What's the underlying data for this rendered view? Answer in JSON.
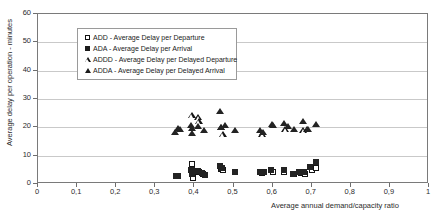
{
  "chart_data": {
    "type": "scatter",
    "title": "",
    "xlabel": "Average annual demand/capacity ratio",
    "ylabel": "Average delay per operation - minutes",
    "xlim": [
      0,
      1
    ],
    "ylim": [
      0,
      60
    ],
    "grid": "horizontal",
    "legend_position": "top-left-inside",
    "xticks": [
      "0",
      "0,1",
      "0,2",
      "0,3",
      "0,4",
      "0,5",
      "0,6",
      "0,7",
      "0,8",
      "0,9",
      "1"
    ],
    "xtick_values": [
      0,
      0.1,
      0.2,
      0.3,
      0.4,
      0.5,
      0.6,
      0.7,
      0.8,
      0.9,
      1
    ],
    "yticks": [
      "0",
      "10",
      "20",
      "30",
      "40",
      "50",
      "60"
    ],
    "ytick_values": [
      0,
      10,
      20,
      30,
      40,
      50,
      60
    ],
    "series": [
      {
        "name": "ADD - Average Delay per Departure",
        "key": "ADD",
        "marker": "square-open",
        "color": "#141414",
        "points": [
          [
            0.395,
            7.0
          ],
          [
            0.396,
            4.4
          ],
          [
            0.397,
            2.2
          ],
          [
            0.405,
            4.6
          ],
          [
            0.412,
            4.2
          ],
          [
            0.423,
            3.4
          ],
          [
            0.468,
            5.2
          ],
          [
            0.474,
            4.9
          ],
          [
            0.573,
            4.0
          ],
          [
            0.6,
            4.3
          ],
          [
            0.63,
            4.4
          ],
          [
            0.655,
            3.5
          ],
          [
            0.672,
            3.9
          ],
          [
            0.684,
            3.6
          ],
          [
            0.7,
            4.9
          ],
          [
            0.712,
            5.8
          ]
        ]
      },
      {
        "name": "ADA - Average Delay per Arrival",
        "key": "ADA",
        "marker": "square-filled",
        "color": "#232323",
        "points": [
          [
            0.352,
            3.0
          ],
          [
            0.357,
            2.9
          ],
          [
            0.392,
            5.1
          ],
          [
            0.393,
            3.7
          ],
          [
            0.394,
            4.9
          ],
          [
            0.408,
            4.6
          ],
          [
            0.42,
            4.0
          ],
          [
            0.427,
            3.1
          ],
          [
            0.466,
            6.3
          ],
          [
            0.47,
            5.6
          ],
          [
            0.504,
            4.2
          ],
          [
            0.568,
            4.3
          ],
          [
            0.578,
            4.1
          ],
          [
            0.597,
            5.0
          ],
          [
            0.628,
            5.0
          ],
          [
            0.652,
            3.6
          ],
          [
            0.668,
            4.1
          ],
          [
            0.68,
            4.3
          ],
          [
            0.695,
            6.0
          ],
          [
            0.71,
            7.7
          ]
        ]
      },
      {
        "name": "ADDD - Average Delay per Delayed Departure",
        "key": "ADDD",
        "marker": "triangle-open",
        "color": "#141414",
        "points": [
          [
            0.393,
            24.2
          ],
          [
            0.409,
            23.7
          ],
          [
            0.411,
            22.3
          ],
          [
            0.468,
            20.0
          ],
          [
            0.472,
            17.6
          ],
          [
            0.573,
            17.4
          ],
          [
            0.632,
            19.3
          ],
          [
            0.678,
            18.9
          ],
          [
            0.688,
            19.2
          ]
        ]
      },
      {
        "name": "ADDA - Average Delay per Delayed Arrival",
        "key": "ADDA",
        "marker": "triangle-filled",
        "color": "#232323",
        "points": [
          [
            0.35,
            18.1
          ],
          [
            0.357,
            19.6
          ],
          [
            0.362,
            19.4
          ],
          [
            0.392,
            20.8
          ],
          [
            0.393,
            19.6
          ],
          [
            0.394,
            17.9
          ],
          [
            0.409,
            20.5
          ],
          [
            0.424,
            19.0
          ],
          [
            0.466,
            25.5
          ],
          [
            0.468,
            20.1
          ],
          [
            0.477,
            20.6
          ],
          [
            0.505,
            19.1
          ],
          [
            0.568,
            18.9
          ],
          [
            0.575,
            18.2
          ],
          [
            0.598,
            21.2
          ],
          [
            0.602,
            20.6
          ],
          [
            0.628,
            21.3
          ],
          [
            0.64,
            20.2
          ],
          [
            0.655,
            19.2
          ],
          [
            0.678,
            22.3
          ],
          [
            0.69,
            19.4
          ],
          [
            0.712,
            21.2
          ]
        ]
      }
    ]
  },
  "legend": {
    "items": [
      {
        "marker": "square-open",
        "label": "ADD - Average Delay per Departure"
      },
      {
        "marker": "square-filled",
        "label": "ADA - Average Delay per Arrival"
      },
      {
        "marker": "triangle-open",
        "label": "ADDD - Average Delay per Delayed Departure"
      },
      {
        "marker": "triangle-filled",
        "label": "ADDA - Average Delay per Delayed Arrival"
      }
    ]
  }
}
